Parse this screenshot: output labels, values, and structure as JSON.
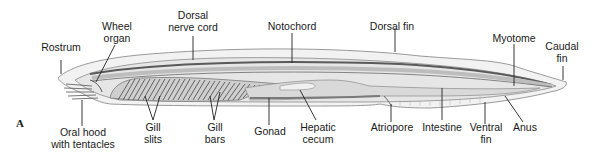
{
  "figure": {
    "panel_letter": "A",
    "colors": {
      "outline": "#9a9a9a",
      "body_fill": "#e6e6e6",
      "fin_fill": "#f2f2f2",
      "dark_band": "#5a5a5a",
      "gill_fill": "#cfcfcf",
      "gill_bar": "#555555",
      "notochord": "#bdbdbd",
      "gut": "#d9d9d9",
      "gonad": "#7a7a7a",
      "leader_line": "#222222",
      "label_text": "#1a1a1a"
    }
  },
  "labels": {
    "rostrum": "Rostrum",
    "wheel_organ": "Wheel\norgan",
    "dorsal_nerve_cord": "Dorsal\nnerve cord",
    "notochord": "Notochord",
    "dorsal_fin": "Dorsal fin",
    "myotome": "Myotome",
    "caudal_fin": "Caudal\nfin",
    "oral_hood": "Oral hood\nwith tentacles",
    "gill_slits": "Gill\nslits",
    "gill_bars": "Gill\nbars",
    "gonad": "Gonad",
    "hepatic_cecum": "Hepatic\ncecum",
    "atriopore": "Atriopore",
    "intestine": "Intestine",
    "ventral_fin": "Ventral\nfin",
    "anus": "Anus"
  }
}
